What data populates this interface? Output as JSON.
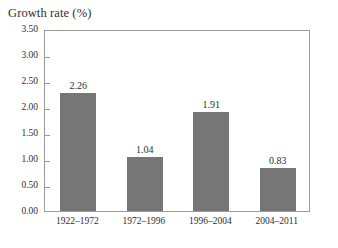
{
  "chart_data": {
    "type": "bar",
    "title": "Growth rate (%)",
    "xlabel": "",
    "ylabel": "Growth rate (%)",
    "categories": [
      "1922–1972",
      "1972–1996",
      "1996–2004",
      "2004–2011"
    ],
    "values": [
      2.26,
      1.04,
      1.91,
      0.83
    ],
    "value_labels": [
      "2.26",
      "1.04",
      "1.91",
      "0.83"
    ],
    "ylim": [
      0.0,
      3.5
    ],
    "ytick_step": 0.5,
    "ytick_labels": [
      "3.50",
      "3.00",
      "2.50",
      "2.00",
      "1.50",
      "1.00",
      "0.50",
      "0.00"
    ],
    "ytick_values": [
      3.5,
      3.0,
      2.5,
      2.0,
      1.5,
      1.0,
      0.5,
      0.0
    ],
    "grid": false,
    "legend": false,
    "legend_position": "none",
    "bar_color": "#767676",
    "frame_color": "#9a9a9a",
    "background_color": "#ffffff",
    "text_color": "#2e2e2e"
  }
}
